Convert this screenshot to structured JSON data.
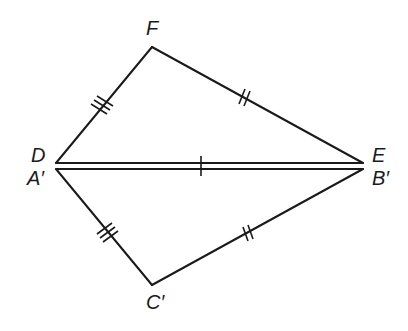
{
  "diagram": {
    "type": "geometry-congruent-triangles",
    "vertices": {
      "F": {
        "label": "F",
        "x": 152,
        "y": 47
      },
      "D": {
        "label": "D",
        "x": 56,
        "y": 163
      },
      "E": {
        "label": "E",
        "x": 363,
        "y": 163
      },
      "A_prime": {
        "label": "A′",
        "x": 56,
        "y": 169
      },
      "B_prime": {
        "label": "B′",
        "x": 363,
        "y": 169
      },
      "C_prime": {
        "label": "C′",
        "x": 152,
        "y": 285
      }
    },
    "labels": {
      "F": "F",
      "D": "D",
      "E": "E",
      "A_prime": "A′",
      "B_prime": "B′",
      "C_prime": "C′"
    },
    "segments": [
      {
        "from": "D",
        "to": "F",
        "tick_marks": 3
      },
      {
        "from": "F",
        "to": "E",
        "tick_marks": 2
      },
      {
        "from": "D",
        "to": "E",
        "tick_marks": 1
      },
      {
        "from": "A_prime",
        "to": "B_prime",
        "tick_marks": 1
      },
      {
        "from": "A_prime",
        "to": "C_prime",
        "tick_marks": 3
      },
      {
        "from": "C_prime",
        "to": "B_prime",
        "tick_marks": 2
      }
    ],
    "colors": {
      "stroke": "#1a1a1a",
      "background": "#ffffff"
    }
  }
}
